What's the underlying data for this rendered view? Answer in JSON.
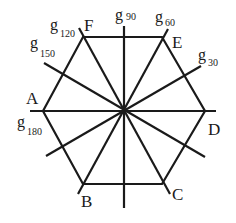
{
  "diagram": {
    "center": {
      "x": 124,
      "y": 111
    },
    "vertices": [
      {
        "name": "A",
        "label": "A",
        "x": 43,
        "y": 111,
        "lx": 26,
        "ly": 104
      },
      {
        "name": "B",
        "label": "B",
        "x": 83,
        "y": 184,
        "lx": 81,
        "ly": 207
      },
      {
        "name": "C",
        "label": "C",
        "x": 162,
        "y": 184,
        "lx": 172,
        "ly": 200
      },
      {
        "name": "D",
        "label": "D",
        "x": 205,
        "y": 111,
        "lx": 208,
        "ly": 135
      },
      {
        "name": "E",
        "label": "E",
        "x": 162,
        "y": 37,
        "lx": 172,
        "ly": 48
      },
      {
        "name": "F",
        "label": "F",
        "x": 83,
        "y": 37,
        "lx": 84,
        "ly": 31
      }
    ],
    "axes": [
      {
        "name": "g30",
        "g": "g",
        "sub": "30",
        "x1": 46,
        "y1": 156,
        "x2": 201,
        "y2": 66,
        "lx": 198,
        "ly": 60,
        "sx": 208,
        "sy": 66
      },
      {
        "name": "g60",
        "g": "g",
        "sub": "60",
        "x1": 78,
        "y1": 194,
        "x2": 168,
        "y2": 29,
        "lx": 155,
        "ly": 22,
        "sx": 165,
        "sy": 26
      },
      {
        "name": "g90",
        "g": "g",
        "sub": "90",
        "x1": 124,
        "y1": 26,
        "x2": 124,
        "y2": 208,
        "lx": 115,
        "ly": 20,
        "sx": 126,
        "sy": 20
      },
      {
        "name": "g120",
        "g": "g",
        "sub": "120",
        "x1": 79,
        "y1": 28,
        "x2": 170,
        "y2": 194,
        "lx": 50,
        "ly": 30,
        "sx": 60,
        "sy": 37
      },
      {
        "name": "g150",
        "g": "g",
        "sub": "150",
        "x1": 44,
        "y1": 63,
        "x2": 205,
        "y2": 157,
        "lx": 30,
        "ly": 48,
        "sx": 40,
        "sy": 57
      },
      {
        "name": "g180",
        "g": "g",
        "sub": "180",
        "x1": 30,
        "y1": 111,
        "x2": 216,
        "y2": 111,
        "lx": 17,
        "ly": 127,
        "sx": 27,
        "sy": 135
      }
    ]
  }
}
